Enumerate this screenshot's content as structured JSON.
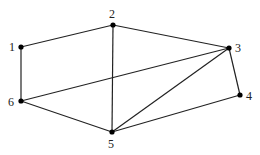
{
  "diagram": {
    "type": "undirected-graph",
    "nodes": [
      {
        "id": "1",
        "label": "1",
        "x": 21,
        "y": 47,
        "lx": 9,
        "ly": 51
      },
      {
        "id": "2",
        "label": "2",
        "x": 113,
        "y": 25,
        "lx": 109,
        "ly": 18
      },
      {
        "id": "3",
        "label": "3",
        "x": 229,
        "y": 48,
        "lx": 235,
        "ly": 52
      },
      {
        "id": "4",
        "label": "4",
        "x": 240,
        "y": 95,
        "lx": 246,
        "ly": 100
      },
      {
        "id": "5",
        "label": "5",
        "x": 112,
        "y": 132,
        "lx": 108,
        "ly": 148
      },
      {
        "id": "6",
        "label": "6",
        "x": 21,
        "y": 101,
        "lx": 8,
        "ly": 106
      }
    ],
    "edges": [
      {
        "from": "1",
        "to": "2"
      },
      {
        "from": "1",
        "to": "6"
      },
      {
        "from": "2",
        "to": "3"
      },
      {
        "from": "2",
        "to": "5"
      },
      {
        "from": "3",
        "to": "6"
      },
      {
        "from": "3",
        "to": "5"
      },
      {
        "from": "3",
        "to": "4"
      },
      {
        "from": "4",
        "to": "5"
      },
      {
        "from": "5",
        "to": "6"
      }
    ],
    "colors": {
      "edge": "#222222",
      "node": "#000000",
      "label": "#222222",
      "background": "#ffffff"
    }
  }
}
